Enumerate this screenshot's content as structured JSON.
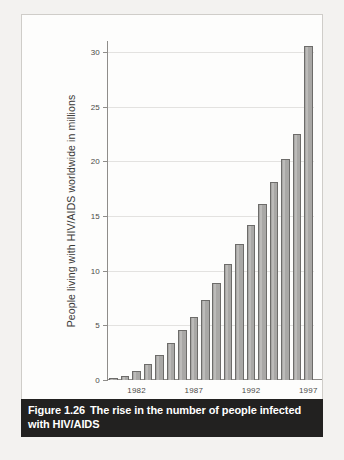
{
  "figure": {
    "caption_number": "Figure 1.26",
    "caption_text": "The rise in the number of people infected with HIV/AIDS"
  },
  "chart_data": {
    "type": "bar",
    "title": "",
    "xlabel": "",
    "ylabel": "People living with HIV/AIDS worldwide in millions",
    "ylim": [
      0,
      31
    ],
    "ytick_labels": [
      "0",
      "5",
      "10",
      "15",
      "20",
      "25",
      "30"
    ],
    "ytick_values": [
      0,
      5,
      10,
      15,
      20,
      25,
      30
    ],
    "xtick_labels": [
      "1982",
      "1987",
      "1992",
      "1997"
    ],
    "xtick_values": [
      1982,
      1987,
      1992,
      1997
    ],
    "grid": true,
    "legend": "none",
    "bar_color": "#a9a8a6",
    "bar_edge_color": "#6d6c6a",
    "categories": [
      1980,
      1981,
      1982,
      1983,
      1984,
      1985,
      1986,
      1987,
      1988,
      1989,
      1990,
      1991,
      1992,
      1993,
      1994,
      1995,
      1996,
      1997
    ],
    "values": [
      0.2,
      0.4,
      0.8,
      1.5,
      2.3,
      3.4,
      4.6,
      5.8,
      7.3,
      8.9,
      10.6,
      12.4,
      14.2,
      16.1,
      18.1,
      20.2,
      22.5,
      30.5
    ]
  }
}
